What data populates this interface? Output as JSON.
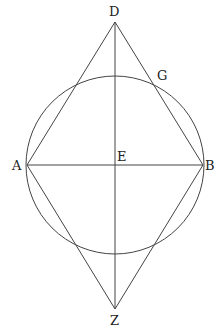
{
  "diagram": {
    "type": "geometry",
    "labels": {
      "D": "D",
      "G": "G",
      "A": "A",
      "E": "E",
      "B": "B",
      "Z": "Z"
    },
    "points": {
      "D": [
        115,
        22
      ],
      "G": [
        154,
        82
      ],
      "A": [
        27,
        165
      ],
      "E": [
        115,
        165
      ],
      "B": [
        203,
        165
      ],
      "Z": [
        115,
        309
      ]
    },
    "circle": {
      "center": "E",
      "radius": 89
    },
    "segments": [
      "DA",
      "DB",
      "ZA",
      "ZB",
      "AB",
      "DZ"
    ],
    "colors": {
      "stroke": "#444444",
      "text": "#222222",
      "background": "#ffffff"
    }
  }
}
